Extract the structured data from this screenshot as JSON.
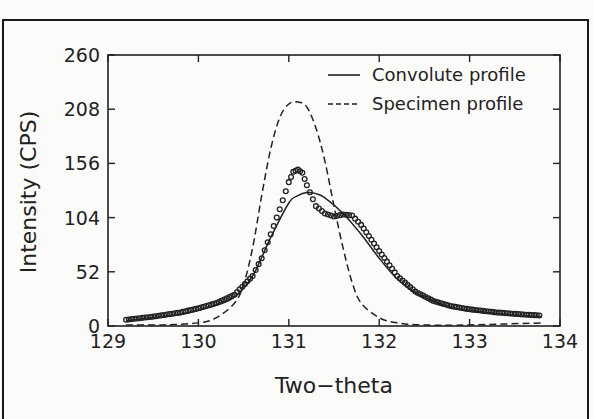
{
  "chart_data": {
    "type": "line",
    "title": "",
    "xlabel": "Two−theta",
    "ylabel": "Intensity (CPS)",
    "xlim": [
      129,
      134
    ],
    "ylim": [
      0,
      260
    ],
    "xticks": [
      129,
      130,
      131,
      132,
      133,
      134
    ],
    "yticks": [
      0,
      52,
      104,
      156,
      208,
      260
    ],
    "xtick_labels": [
      "129",
      "130",
      "131",
      "132",
      "133",
      "134"
    ],
    "ytick_labels": [
      "0",
      "52",
      "104",
      "156",
      "208",
      "260"
    ],
    "grid": false,
    "legend_position": "upper right",
    "legend": [
      {
        "label": "Convolute profile",
        "style": "solid"
      },
      {
        "label": "Specimen profile",
        "style": "dashed"
      }
    ],
    "series": [
      {
        "name": "Convolute profile",
        "style": "solid",
        "x": [
          129.2,
          129.5,
          129.8,
          130.0,
          130.2,
          130.4,
          130.6,
          130.8,
          131.0,
          131.1,
          131.2,
          131.3,
          131.4,
          131.6,
          131.8,
          132.0,
          132.2,
          132.4,
          132.6,
          132.8,
          133.0,
          133.3,
          133.6,
          133.8
        ],
        "values": [
          5,
          8,
          11,
          15,
          20,
          28,
          48,
          85,
          118,
          125,
          128,
          127,
          123,
          108,
          88,
          65,
          45,
          32,
          24,
          18,
          15,
          12,
          10,
          9
        ]
      },
      {
        "name": "Specimen profile",
        "style": "dashed",
        "x": [
          129.2,
          129.6,
          130.0,
          130.2,
          130.4,
          130.5,
          130.6,
          130.7,
          130.8,
          130.9,
          131.0,
          131.1,
          131.2,
          131.3,
          131.4,
          131.5,
          131.6,
          131.7,
          131.8,
          132.0,
          132.2,
          132.5,
          133.0,
          133.8
        ],
        "values": [
          1,
          1,
          3,
          8,
          22,
          40,
          75,
          125,
          170,
          200,
          213,
          215,
          210,
          190,
          158,
          115,
          75,
          42,
          22,
          8,
          3,
          1,
          1,
          3
        ]
      },
      {
        "name": "Observed data",
        "style": "markers",
        "x": [
          129.2,
          129.5,
          129.8,
          130.0,
          130.2,
          130.4,
          130.6,
          130.7,
          130.8,
          130.9,
          131.0,
          131.05,
          131.1,
          131.15,
          131.2,
          131.3,
          131.4,
          131.5,
          131.6,
          131.7,
          131.8,
          132.0,
          132.2,
          132.4,
          132.6,
          132.8,
          133.0,
          133.3,
          133.6,
          133.8
        ],
        "values": [
          6,
          9,
          13,
          17,
          22,
          30,
          48,
          65,
          88,
          112,
          138,
          148,
          150,
          147,
          135,
          115,
          108,
          105,
          107,
          106,
          97,
          72,
          48,
          33,
          24,
          19,
          16,
          13,
          11,
          10
        ]
      }
    ]
  }
}
